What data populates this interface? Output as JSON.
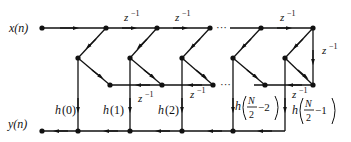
{
  "diagram": {
    "type": "linear-phase FIR filter signal flow graph (even N)",
    "colors": {
      "line": "#111111",
      "background": "#ffffff"
    },
    "labels": {
      "input": "x(n)",
      "output": "y(n)",
      "delay": "z",
      "delay_exp": "−1",
      "ellipsis": "···"
    },
    "coefficients": [
      {
        "h": "h",
        "arg": "0"
      },
      {
        "h": "h",
        "arg": "1"
      },
      {
        "h": "h",
        "arg": "2"
      },
      {
        "h": "h",
        "num": "N",
        "den": "2",
        "offset": "−2"
      },
      {
        "h": "h",
        "num": "N",
        "den": "2",
        "offset": "−1"
      }
    ]
  }
}
